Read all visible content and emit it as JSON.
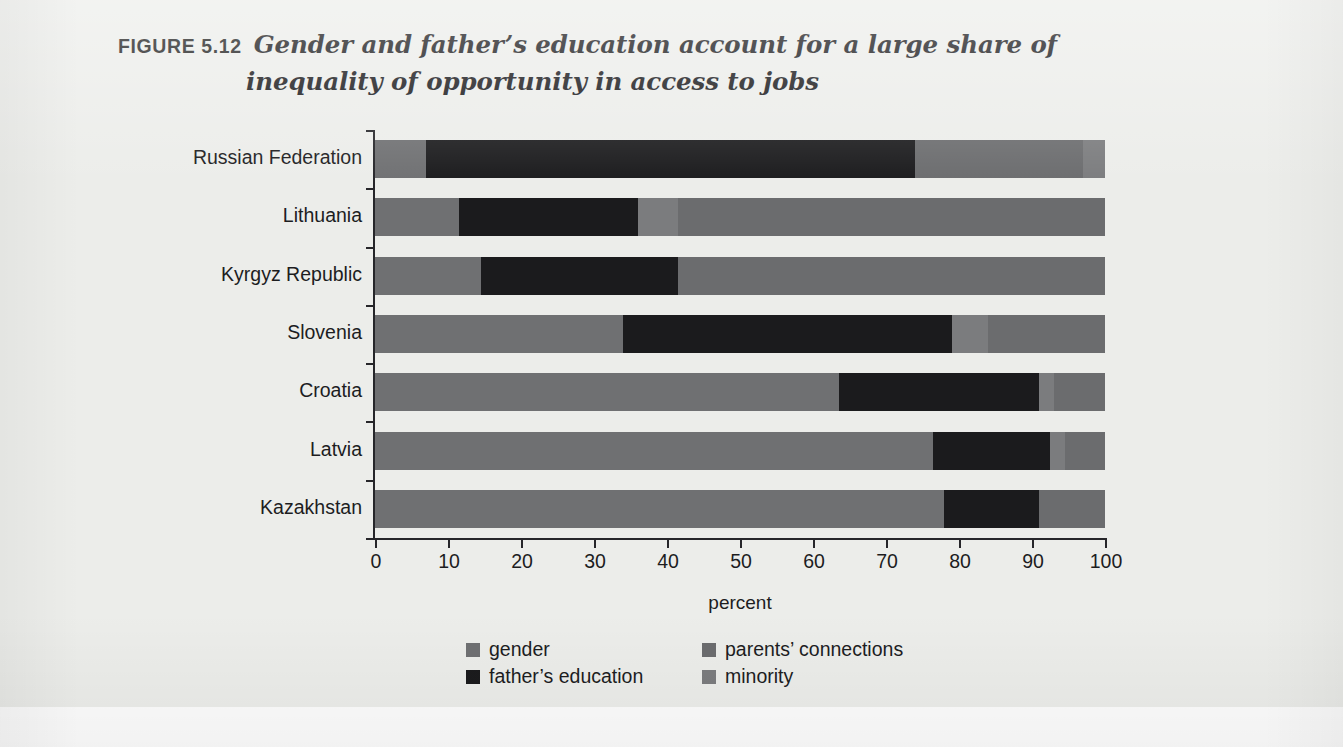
{
  "figure": {
    "label": "FIGURE 5.12",
    "caption_line1": "Gender and father’s education account for a large share of",
    "caption_line2": "inequality of opportunity in access to jobs"
  },
  "colors": {
    "background": "#ecedea",
    "axis": "#26262a",
    "gender": "#6f7072",
    "fathers_education": "#1b1b1d",
    "parents_connections": "#6b6c6e",
    "minority": "#7b7c7e",
    "text": "#1d1d1f"
  },
  "legend": {
    "items": [
      {
        "label": "gender",
        "color_key": "gender",
        "swatch": "#6f7072",
        "column": "left"
      },
      {
        "label": "father’s education",
        "color_key": "fathers_education",
        "swatch": "#1b1b1d",
        "column": "left"
      },
      {
        "label": "parents’ connections",
        "color_key": "parents_connections",
        "swatch": "#6b6c6e",
        "column": "right"
      },
      {
        "label": "minority",
        "color_key": "minority",
        "swatch": "#7b7c7e",
        "column": "right"
      }
    ]
  },
  "chart_data": {
    "type": "bar",
    "orientation": "horizontal",
    "stacked": true,
    "stack_mode": "percent",
    "title": "Gender and father’s education account for a large share of inequality of opportunity in access to jobs",
    "subtitle": "",
    "xlabel": "percent",
    "ylabel": "",
    "xlim": [
      0,
      100
    ],
    "xticks": [
      0,
      10,
      20,
      30,
      40,
      50,
      60,
      70,
      80,
      90,
      100
    ],
    "xtick_labels": [
      "0",
      "10",
      "20",
      "30",
      "40",
      "50",
      "60",
      "70",
      "80",
      "90",
      "100"
    ],
    "grid": false,
    "legend_position": "bottom",
    "categories": [
      "Russian Federation",
      "Lithuania",
      "Kyrgyz Republic",
      "Slovenia",
      "Croatia",
      "Latvia",
      "Kazakhstan"
    ],
    "series": [
      {
        "name": "gender",
        "values": [
          7.0,
          11.5,
          14.5,
          34.0,
          63.5,
          76.5,
          78.0
        ]
      },
      {
        "name": "father’s education",
        "values": [
          67.0,
          24.5,
          27.0,
          45.0,
          27.5,
          16.0,
          13.0
        ]
      },
      {
        "name": "minority",
        "values": [
          3.0,
          5.5,
          0.0,
          5.0,
          2.0,
          2.0,
          0.0
        ]
      },
      {
        "name": "parents’ connections",
        "values": [
          23.0,
          58.5,
          58.5,
          16.0,
          7.0,
          5.5,
          9.0
        ]
      }
    ],
    "bars": [
      {
        "category": "Russian Federation",
        "segments": [
          {
            "name": "gender",
            "start": 0.0,
            "end": 7.0,
            "value": 7.0
          },
          {
            "name": "father’s education",
            "start": 7.0,
            "end": 74.0,
            "value": 67.0
          },
          {
            "name": "parents’ connections",
            "start": 74.0,
            "end": 97.0,
            "value": 23.0
          },
          {
            "name": "minority",
            "start": 97.0,
            "end": 100.0,
            "value": 3.0
          }
        ]
      },
      {
        "category": "Lithuania",
        "segments": [
          {
            "name": "gender",
            "start": 0.0,
            "end": 11.5,
            "value": 11.5
          },
          {
            "name": "father’s education",
            "start": 11.5,
            "end": 36.0,
            "value": 24.5
          },
          {
            "name": "minority",
            "start": 36.0,
            "end": 41.5,
            "value": 5.5
          },
          {
            "name": "parents’ connections",
            "start": 41.5,
            "end": 100.0,
            "value": 58.5
          }
        ]
      },
      {
        "category": "Kyrgyz Republic",
        "segments": [
          {
            "name": "gender",
            "start": 0.0,
            "end": 14.5,
            "value": 14.5
          },
          {
            "name": "father’s education",
            "start": 14.5,
            "end": 41.5,
            "value": 27.0
          },
          {
            "name": "parents’ connections",
            "start": 41.5,
            "end": 100.0,
            "value": 58.5
          }
        ]
      },
      {
        "category": "Slovenia",
        "segments": [
          {
            "name": "gender",
            "start": 0.0,
            "end": 34.0,
            "value": 34.0
          },
          {
            "name": "father’s education",
            "start": 34.0,
            "end": 79.0,
            "value": 45.0
          },
          {
            "name": "minority",
            "start": 79.0,
            "end": 84.0,
            "value": 5.0
          },
          {
            "name": "parents’ connections",
            "start": 84.0,
            "end": 100.0,
            "value": 16.0
          }
        ]
      },
      {
        "category": "Croatia",
        "segments": [
          {
            "name": "gender",
            "start": 0.0,
            "end": 63.5,
            "value": 63.5
          },
          {
            "name": "father’s education",
            "start": 63.5,
            "end": 91.0,
            "value": 27.5
          },
          {
            "name": "minority",
            "start": 91.0,
            "end": 93.0,
            "value": 2.0
          },
          {
            "name": "parents’ connections",
            "start": 93.0,
            "end": 100.0,
            "value": 7.0
          }
        ]
      },
      {
        "category": "Latvia",
        "segments": [
          {
            "name": "gender",
            "start": 0.0,
            "end": 76.5,
            "value": 76.5
          },
          {
            "name": "father’s education",
            "start": 76.5,
            "end": 92.5,
            "value": 16.0
          },
          {
            "name": "minority",
            "start": 92.5,
            "end": 94.5,
            "value": 2.0
          },
          {
            "name": "parents’ connections",
            "start": 94.5,
            "end": 100.0,
            "value": 5.5
          }
        ]
      },
      {
        "category": "Kazakhstan",
        "segments": [
          {
            "name": "gender",
            "start": 0.0,
            "end": 78.0,
            "value": 78.0
          },
          {
            "name": "father’s education",
            "start": 78.0,
            "end": 91.0,
            "value": 13.0
          },
          {
            "name": "parents’ connections",
            "start": 91.0,
            "end": 100.0,
            "value": 9.0
          }
        ]
      }
    ]
  }
}
